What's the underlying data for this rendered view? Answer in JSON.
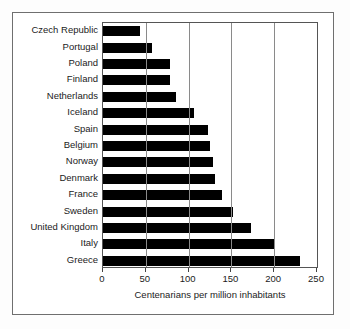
{
  "chart_data": {
    "type": "bar",
    "orientation": "horizontal",
    "title": "",
    "xlabel": "Centenarians per million inhabitants",
    "ylabel": "",
    "xlim": [
      0,
      250
    ],
    "xticks": [
      0,
      50,
      100,
      150,
      200,
      250
    ],
    "grid": true,
    "legend": false,
    "bar_color": "#000000",
    "categories": [
      "Czech Republic",
      "Portugal",
      "Poland",
      "Finland",
      "Netherlands",
      "Iceland",
      "Spain",
      "Belgium",
      "Norway",
      "Denmark",
      "France",
      "Sweden",
      "United Kingdom",
      "Italy",
      "Greece"
    ],
    "values": [
      43,
      57,
      78,
      78,
      85,
      106,
      123,
      125,
      128,
      131,
      139,
      152,
      173,
      200,
      230
    ]
  },
  "axis": {
    "tick_0": "0",
    "tick_1": "50",
    "tick_2": "100",
    "tick_3": "150",
    "tick_4": "200",
    "tick_5": "250"
  }
}
